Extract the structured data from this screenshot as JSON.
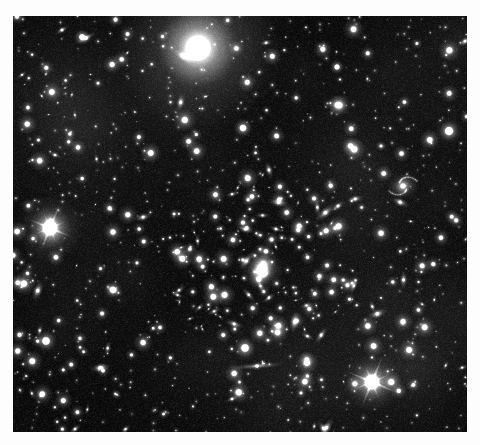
{
  "image": {
    "kind": "astronomical-photograph",
    "subject": "deep-field galaxy cluster",
    "caption": "",
    "frame": {
      "x": 13,
      "y": 16,
      "width": 454,
      "height": 416
    },
    "background_color": "#050505",
    "page_background_color": "#fdfdfd",
    "star_color": "#ffffff",
    "sky_glow_color": "#141414",
    "noise_color": "#2a2a2a"
  },
  "sky_objects": {
    "bright_stars": [
      {
        "name": "overexposed-star-top",
        "x": 198,
        "y": 48,
        "r": 27,
        "core": 13,
        "brightness": 1.0,
        "spikes": 0,
        "halo": 3.1
      },
      {
        "name": "diffraction-star-left",
        "x": 50,
        "y": 228,
        "r": 14,
        "core": 8,
        "brightness": 1.0,
        "spikes": 8,
        "spike_len": 26,
        "halo": 2.4
      },
      {
        "name": "diffraction-star-bottom-right",
        "x": 372,
        "y": 382,
        "r": 13,
        "core": 8,
        "brightness": 1.0,
        "spikes": 8,
        "spike_len": 30,
        "halo": 2.3
      },
      {
        "name": "bright-star-right-edge",
        "x": 449,
        "y": 131,
        "r": 6.5,
        "core": 4.5,
        "brightness": 0.98,
        "spikes": 0,
        "halo": 2.0
      },
      {
        "name": "bright-star-lower-left",
        "x": 46,
        "y": 341,
        "r": 6.0,
        "core": 4.2,
        "brightness": 0.96,
        "spikes": 0,
        "halo": 2.0
      },
      {
        "name": "bright-star-mid-left",
        "x": 113,
        "y": 290,
        "r": 5.2,
        "core": 3.6,
        "brightness": 0.94,
        "spikes": 0,
        "halo": 1.9
      },
      {
        "name": "bright-star-upper-mid",
        "x": 243,
        "y": 128,
        "r": 5.4,
        "core": 3.6,
        "brightness": 0.93,
        "spikes": 0,
        "halo": 1.9
      },
      {
        "name": "bright-star-center-core",
        "x": 245,
        "y": 348,
        "r": 6.2,
        "core": 4.2,
        "brightness": 0.97,
        "spikes": 0,
        "halo": 2.0
      },
      {
        "name": "bright-star-upper-left",
        "x": 82,
        "y": 37,
        "r": 4.6,
        "core": 3.2,
        "brightness": 0.92,
        "spikes": 0,
        "halo": 1.8
      },
      {
        "name": "bright-star-top-right-small",
        "x": 337,
        "y": 67,
        "r": 4.2,
        "core": 2.9,
        "brightness": 0.9,
        "spikes": 0,
        "halo": 1.8
      }
    ],
    "cluster": {
      "name": "central-galaxy-cluster",
      "center_x": 262,
      "center_y": 267,
      "radius": 95,
      "cd_galaxy": {
        "x": 262,
        "y": 269,
        "r": 22,
        "core": 5.5,
        "brightness": 0.82
      },
      "member_count": 120
    },
    "galaxies": [
      {
        "name": "spiral-galaxy-right",
        "x": 403,
        "y": 186,
        "rx": 15,
        "ry": 13,
        "angle": -15,
        "core": 3.4,
        "brightness": 0.72,
        "type": "spiral"
      },
      {
        "name": "edge-on-galaxy-bottom",
        "x": 257,
        "y": 366,
        "rx": 27,
        "ry": 3.2,
        "angle": -4,
        "core": 2.4,
        "brightness": 0.7,
        "type": "edge-on"
      },
      {
        "name": "elongated-streak-top-left",
        "x": 86,
        "y": 38,
        "rx": 12,
        "ry": 3.0,
        "angle": -28,
        "core": 2.6,
        "brightness": 0.8,
        "type": "edge-on"
      },
      {
        "name": "elongated-galaxy-upper-left",
        "x": 62,
        "y": 30,
        "rx": 8,
        "ry": 2.6,
        "angle": -32,
        "core": 2.0,
        "brightness": 0.66,
        "type": "edge-on"
      },
      {
        "name": "elongated-galaxy-mid-left",
        "x": 55,
        "y": 155,
        "rx": 7,
        "ry": 2.4,
        "angle": 20,
        "core": 1.9,
        "brightness": 0.58,
        "type": "edge-on"
      },
      {
        "name": "elongated-galaxy-center",
        "x": 276,
        "y": 229,
        "rx": 8,
        "ry": 2.6,
        "angle": 18,
        "core": 2.0,
        "brightness": 0.62,
        "type": "edge-on"
      },
      {
        "name": "elongated-galaxy-cluster-ne",
        "x": 338,
        "y": 206,
        "rx": 9,
        "ry": 3.0,
        "angle": -35,
        "core": 2.2,
        "brightness": 0.64,
        "type": "edge-on"
      },
      {
        "name": "elongated-galaxy-sw",
        "x": 112,
        "y": 289,
        "rx": 7,
        "ry": 2.4,
        "angle": 10,
        "core": 2.0,
        "brightness": 0.6,
        "type": "edge-on"
      },
      {
        "name": "elongated-galaxy-lower-center",
        "x": 232,
        "y": 399,
        "rx": 7,
        "ry": 2.4,
        "angle": -22,
        "core": 1.9,
        "brightness": 0.58,
        "type": "edge-on"
      },
      {
        "name": "diffuse-galaxy-ne",
        "x": 381,
        "y": 146,
        "rx": 6,
        "ry": 5,
        "angle": 0,
        "core": 2.0,
        "brightness": 0.55,
        "type": "elliptical"
      }
    ],
    "field_star_seed": 20240117,
    "field_star_count": 330,
    "faint_star_count": 520
  }
}
